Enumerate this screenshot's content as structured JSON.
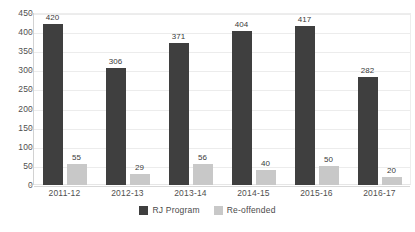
{
  "chart_data": {
    "type": "bar",
    "title": "",
    "subtitle": "",
    "xlabel": "",
    "ylabel": "",
    "categories": [
      "2011-12",
      "2012-13",
      "2013-14",
      "2014-15",
      "2015-16",
      "2016-17"
    ],
    "series": [
      {
        "name": "RJ Program",
        "color": "#3f3f3f",
        "values": [
          420,
          306,
          371,
          404,
          417,
          282
        ]
      },
      {
        "name": "Re-offended",
        "color": "#c8c8c8",
        "values": [
          55,
          29,
          56,
          40,
          50,
          20
        ]
      }
    ],
    "ylim": [
      0,
      450
    ],
    "ytick_step": 50,
    "ytick_labels": [
      "450",
      "400",
      "350",
      "300",
      "250",
      "200",
      "150",
      "100",
      "50",
      "0"
    ],
    "grid": true,
    "grid_axis": "y",
    "legend_position": "bottom-center",
    "data_labels": true
  },
  "legend": {
    "items": [
      {
        "label": "RJ Program",
        "swatch": "rj"
      },
      {
        "label": "Re-offended",
        "swatch": "reoff"
      }
    ]
  }
}
